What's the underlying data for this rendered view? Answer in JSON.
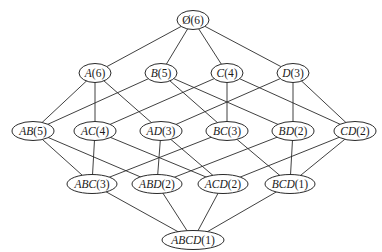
{
  "diagram": {
    "type": "itemset-lattice",
    "colors": {
      "stroke": "#2a2a2a",
      "fill": "#ffffff",
      "text": "#1a1a1a"
    },
    "nodes": [
      {
        "id": "empty",
        "set": "Ø",
        "count": "(6)",
        "x": 193,
        "y": 20,
        "rx": 16,
        "ry": 9.5
      },
      {
        "id": "A",
        "set": "A",
        "count": "(6)",
        "x": 95,
        "y": 73,
        "rx": 16,
        "ry": 9.5
      },
      {
        "id": "B",
        "set": "B",
        "count": "(5)",
        "x": 161,
        "y": 73,
        "rx": 16,
        "ry": 9.5
      },
      {
        "id": "C",
        "set": "C",
        "count": "(4)",
        "x": 227,
        "y": 73,
        "rx": 16,
        "ry": 9.5
      },
      {
        "id": "D",
        "set": "D",
        "count": "(3)",
        "x": 293,
        "y": 73,
        "rx": 16,
        "ry": 9.5
      },
      {
        "id": "AB",
        "set": "AB",
        "count": "(5)",
        "x": 33,
        "y": 131,
        "rx": 21,
        "ry": 9.5
      },
      {
        "id": "AC",
        "set": "AC",
        "count": "(4)",
        "x": 95,
        "y": 131,
        "rx": 21,
        "ry": 9.5
      },
      {
        "id": "AD",
        "set": "AD",
        "count": "(3)",
        "x": 161,
        "y": 131,
        "rx": 21,
        "ry": 9.5
      },
      {
        "id": "BC",
        "set": "BC",
        "count": "(3)",
        "x": 227,
        "y": 131,
        "rx": 21,
        "ry": 9.5
      },
      {
        "id": "BD",
        "set": "BD",
        "count": "(2)",
        "x": 293,
        "y": 131,
        "rx": 21,
        "ry": 9.5
      },
      {
        "id": "CD",
        "set": "CD",
        "count": "(2)",
        "x": 355,
        "y": 131,
        "rx": 21,
        "ry": 9.5
      },
      {
        "id": "ABC",
        "set": "ABC",
        "count": "(3)",
        "x": 92,
        "y": 184,
        "rx": 25,
        "ry": 9.5
      },
      {
        "id": "ABD",
        "set": "ABD",
        "count": "(2)",
        "x": 157,
        "y": 184,
        "rx": 25,
        "ry": 9.5
      },
      {
        "id": "ACD",
        "set": "ACD",
        "count": "(2)",
        "x": 223,
        "y": 184,
        "rx": 25,
        "ry": 9.5
      },
      {
        "id": "BCD",
        "set": "BCD",
        "count": "(1)",
        "x": 290,
        "y": 184,
        "rx": 25,
        "ry": 9.5
      },
      {
        "id": "ABCD",
        "set": "ABCD",
        "count": "(1)",
        "x": 193,
        "y": 240,
        "rx": 31,
        "ry": 9.5
      }
    ],
    "edges": [
      [
        "empty",
        "A"
      ],
      [
        "empty",
        "B"
      ],
      [
        "empty",
        "C"
      ],
      [
        "empty",
        "D"
      ],
      [
        "A",
        "AB"
      ],
      [
        "A",
        "AC"
      ],
      [
        "A",
        "AD"
      ],
      [
        "B",
        "AB"
      ],
      [
        "B",
        "BC"
      ],
      [
        "B",
        "BD"
      ],
      [
        "C",
        "AC"
      ],
      [
        "C",
        "BC"
      ],
      [
        "C",
        "CD"
      ],
      [
        "D",
        "AD"
      ],
      [
        "D",
        "BD"
      ],
      [
        "D",
        "CD"
      ],
      [
        "AB",
        "ABC"
      ],
      [
        "AB",
        "ABD"
      ],
      [
        "AC",
        "ABC"
      ],
      [
        "AC",
        "ACD"
      ],
      [
        "AD",
        "ABD"
      ],
      [
        "AD",
        "ACD"
      ],
      [
        "BC",
        "ABC"
      ],
      [
        "BC",
        "BCD"
      ],
      [
        "BD",
        "ABD"
      ],
      [
        "BD",
        "BCD"
      ],
      [
        "CD",
        "ACD"
      ],
      [
        "CD",
        "BCD"
      ],
      [
        "ABC",
        "ABCD"
      ],
      [
        "ABD",
        "ABCD"
      ],
      [
        "ACD",
        "ABCD"
      ],
      [
        "BCD",
        "ABCD"
      ]
    ]
  }
}
